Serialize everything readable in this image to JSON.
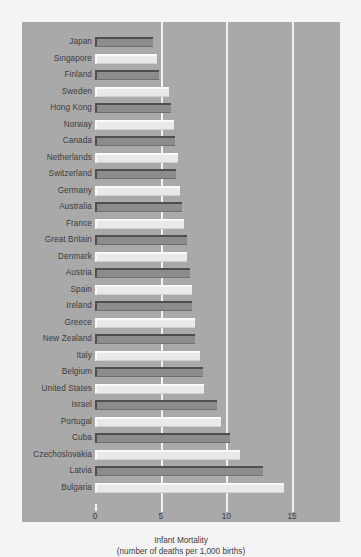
{
  "chart_data": {
    "type": "bar",
    "orientation": "horizontal",
    "title": "",
    "xlabel": "Infant Mortality",
    "xlabel_sub": "(number of deaths per 1,000 births)",
    "ylabel": "",
    "xlim": [
      0,
      15.6
    ],
    "xticks": [
      0,
      5,
      10,
      15
    ],
    "xticklabels": [
      "0",
      "5",
      "10",
      "15"
    ],
    "grid": true,
    "gridlines": [
      5,
      10,
      15
    ],
    "legend": null,
    "categories": [
      "Japan",
      "Singapore",
      "Finland",
      "Sweden",
      "Hong Kong",
      "Norway",
      "Canada",
      "Netherlands",
      "Switzerland",
      "Germany",
      "Australia",
      "France",
      "Great Britain",
      "Denmark",
      "Austria",
      "Spain",
      "Ireland",
      "Greece",
      "New Zealand",
      "Italy",
      "Belgium",
      "United States",
      "Israel",
      "Portugal",
      "Cuba",
      "Czechoslovakia",
      "Latvia",
      "Bulgaria"
    ],
    "values": [
      4.4,
      4.7,
      4.9,
      5.6,
      5.8,
      6.0,
      6.1,
      6.3,
      6.2,
      6.5,
      6.6,
      6.8,
      7.0,
      7.0,
      7.2,
      7.4,
      7.4,
      7.6,
      7.6,
      8.0,
      8.2,
      8.3,
      9.3,
      9.6,
      10.3,
      11.0,
      12.8,
      14.4
    ],
    "bar_styles": [
      "dark",
      "light",
      "dark",
      "light",
      "dark",
      "light",
      "dark",
      "light",
      "dark",
      "light",
      "dark",
      "light",
      "dark",
      "light",
      "dark",
      "light",
      "dark",
      "light",
      "dark",
      "light",
      "dark",
      "light",
      "dark",
      "light",
      "dark",
      "light",
      "dark",
      "light"
    ],
    "colors": {
      "panel_background": "#a9a9a9",
      "figure_background": "#f4f4f4",
      "bar_dark": "#8c8c8c",
      "bar_light": "#e9e9e9",
      "gridline": "#f2f2f2",
      "text": "#3c3c3c"
    }
  }
}
